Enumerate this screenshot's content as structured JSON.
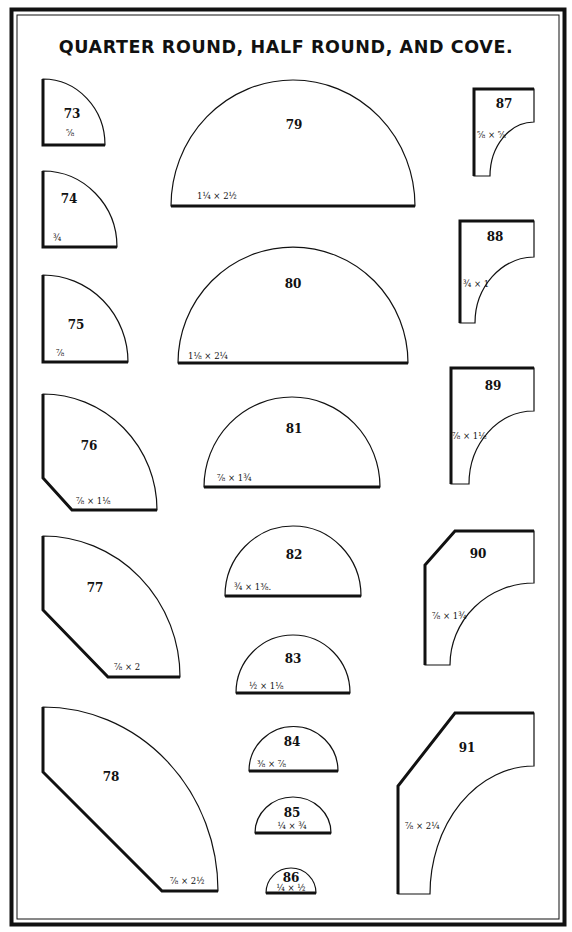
{
  "title": "QUARTER ROUND, HALF ROUND, AND COVE.",
  "colors": {
    "ink": "#111111",
    "paper": "#ffffff"
  },
  "groups": {
    "quarter_round": [
      "73",
      "74",
      "75",
      "76",
      "77",
      "78"
    ],
    "half_round": [
      "79",
      "80",
      "81",
      "82",
      "83",
      "84",
      "85",
      "86"
    ],
    "cove": [
      "87",
      "88",
      "89",
      "90",
      "91"
    ]
  },
  "profiles": [
    {
      "id": "p73",
      "number": "73",
      "type": "quarter-round",
      "dimension": "⅝"
    },
    {
      "id": "p74",
      "number": "74",
      "type": "quarter-round",
      "dimension": "¾"
    },
    {
      "id": "p75",
      "number": "75",
      "type": "quarter-round",
      "dimension": "⅞"
    },
    {
      "id": "p76",
      "number": "76",
      "type": "quarter-round-chamfered",
      "dimension": "⅞ × 1⅛"
    },
    {
      "id": "p77",
      "number": "77",
      "type": "quarter-round-chamfered",
      "dimension": "⅞ × 2"
    },
    {
      "id": "p78",
      "number": "78",
      "type": "quarter-round-chamfered",
      "dimension": "⅞ × 2½"
    },
    {
      "id": "p79",
      "number": "79",
      "type": "half-round",
      "dimension": "1¼ × 2½"
    },
    {
      "id": "p80",
      "number": "80",
      "type": "half-round",
      "dimension": "1⅛ × 2¼"
    },
    {
      "id": "p81",
      "number": "81",
      "type": "half-round",
      "dimension": "⅞ × 1¾"
    },
    {
      "id": "p82",
      "number": "82",
      "type": "half-round",
      "dimension": "¾ × 1⅜."
    },
    {
      "id": "p83",
      "number": "83",
      "type": "half-round",
      "dimension": "½ × 1⅛"
    },
    {
      "id": "p84",
      "number": "84",
      "type": "half-round",
      "dimension": "⅜ × ⅞"
    },
    {
      "id": "p85",
      "number": "85",
      "type": "half-round",
      "dimension": "¼ × ¾"
    },
    {
      "id": "p86",
      "number": "86",
      "type": "half-round",
      "dimension": "¼ × ½"
    },
    {
      "id": "p87",
      "number": "87",
      "type": "cove",
      "dimension": "⅝ × ⅝"
    },
    {
      "id": "p88",
      "number": "88",
      "type": "cove",
      "dimension": "¾ × 1"
    },
    {
      "id": "p89",
      "number": "89",
      "type": "cove",
      "dimension": "⅞ × 1⅛"
    },
    {
      "id": "p90",
      "number": "90",
      "type": "cove-chamfered",
      "dimension": "⅞ × 1¾"
    },
    {
      "id": "p91",
      "number": "91",
      "type": "cove-chamfered",
      "dimension": "⅞ × 2¼"
    }
  ],
  "labels": {
    "p73": {
      "number": "73",
      "dimension": "⅝"
    },
    "p74": {
      "number": "74",
      "dimension": "¾"
    },
    "p75": {
      "number": "75",
      "dimension": "⅞"
    },
    "p76": {
      "number": "76",
      "dimension": "⅞ × 1⅛"
    },
    "p77": {
      "number": "77",
      "dimension": "⅞ × 2"
    },
    "p78": {
      "number": "78",
      "dimension": "⅞ × 2½"
    },
    "p79": {
      "number": "79",
      "dimension": "1¼ × 2½"
    },
    "p80": {
      "number": "80",
      "dimension": "1⅛ × 2¼"
    },
    "p81": {
      "number": "81",
      "dimension": "⅞ × 1¾"
    },
    "p82": {
      "number": "82",
      "dimension": "¾ × 1⅜."
    },
    "p83": {
      "number": "83",
      "dimension": "½ × 1⅛"
    },
    "p84": {
      "number": "84",
      "dimension": "⅜ × ⅞"
    },
    "p85": {
      "number": "85",
      "dimension": "¼ × ¾"
    },
    "p86": {
      "number": "86",
      "dimension": "¼ × ½"
    },
    "p87": {
      "number": "87",
      "dimension": "⅝ × ⅝"
    },
    "p88": {
      "number": "88",
      "dimension": "¾ × 1"
    },
    "p89": {
      "number": "89",
      "dimension": "⅞ × 1⅛"
    },
    "p90": {
      "number": "90",
      "dimension": "⅞ × 1¾"
    },
    "p91": {
      "number": "91",
      "dimension": "⅞ × 2¼"
    }
  }
}
